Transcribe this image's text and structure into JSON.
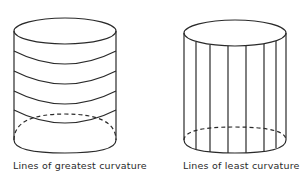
{
  "figure": {
    "panels": [
      {
        "caption": "Lines of greatest curvature",
        "line_orientation": "horizontal",
        "band_count": 4
      },
      {
        "caption": "Lines of least curvature",
        "line_orientation": "vertical",
        "line_count": 6
      }
    ],
    "line_color": "#2a2a2a",
    "background": "#ffffff"
  }
}
